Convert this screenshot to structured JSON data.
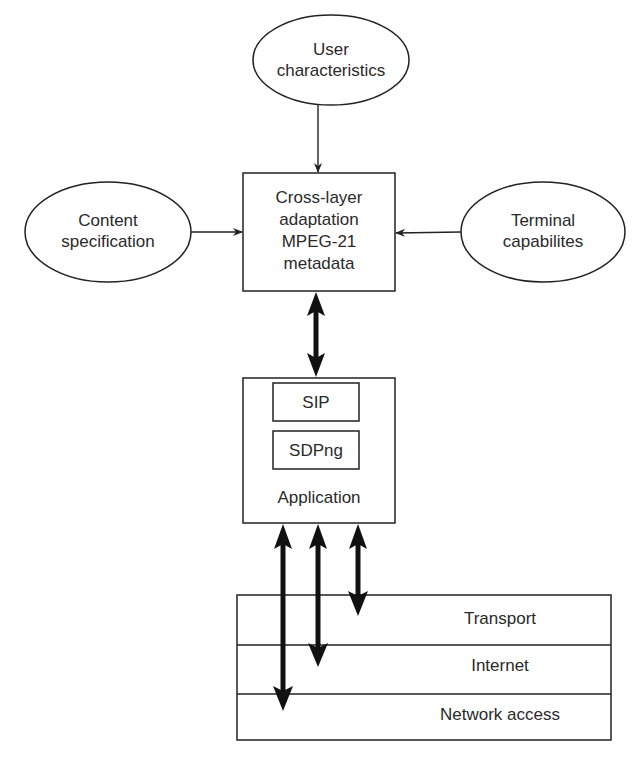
{
  "diagram": {
    "inputs": {
      "user": {
        "line1": "User",
        "line2": "characteristics"
      },
      "content": {
        "line1": "Content",
        "line2": "specification"
      },
      "terminal": {
        "line1": "Terminal",
        "line2": "capabilites"
      }
    },
    "adaptation_box": {
      "line1": "Cross-layer",
      "line2": "adaptation",
      "line3": "MPEG-21",
      "line4": "metadata"
    },
    "application_box": {
      "protocols": [
        "SIP",
        "SDPng"
      ],
      "label": "Application"
    },
    "protocol_stack": {
      "layers": [
        "Transport",
        "Internet",
        "Network access"
      ]
    },
    "colors": {
      "stroke": "#222222",
      "text": "#2a2a2a",
      "background": "#ffffff"
    }
  }
}
